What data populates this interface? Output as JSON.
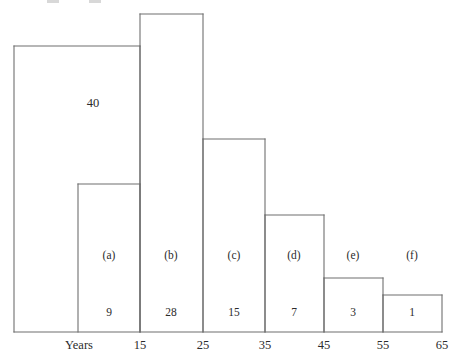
{
  "figure": {
    "background_color": "#ffffff",
    "line_color": "#6f6f6f",
    "text_color": "#2b2b2b",
    "axis_name": "Years"
  },
  "chart_data": {
    "type": "bar",
    "title": "",
    "subtitle": "",
    "xlabel": "Years",
    "ylabel": "",
    "grid": false,
    "legend_position": "none",
    "bin_edges": [
      15,
      25,
      35,
      45,
      55,
      65
    ],
    "bin_edge_labels": [
      "15",
      "25",
      "35",
      "45",
      "55",
      "65"
    ],
    "categories": [
      "(a)",
      "(b)",
      "(c)",
      "(d)",
      "(e)",
      "(f)"
    ],
    "values": [
      9,
      28,
      15,
      7,
      3,
      1
    ],
    "value_labels": [
      "9",
      "28",
      "15",
      "7",
      "3",
      "1"
    ],
    "overlay_bar": {
      "label": "40",
      "value": 40,
      "note": "tall left block spanning up to the 15 edge"
    },
    "ylim": [
      0,
      44
    ],
    "xlim": [
      5,
      65
    ],
    "bars": [
      {
        "id": "total",
        "label": "40",
        "value": 40,
        "x_left_px": 14,
        "x_right_px": 140,
        "top_px": 46,
        "bottom_px": 332,
        "label_x_px": 93,
        "label_y_px": 103
      },
      {
        "id": "a",
        "label": "(a)",
        "value": 9,
        "value_label": "9",
        "x_left_px": 78,
        "x_right_px": 140,
        "top_px": 184,
        "bottom_px": 332,
        "label_x_px": 109,
        "label_y_px": 256,
        "value_x_px": 109,
        "value_y_px": 313
      },
      {
        "id": "b",
        "label": "(b)",
        "value": 28,
        "value_label": "28",
        "x_left_px": 140,
        "x_right_px": 203,
        "top_px": 14,
        "bottom_px": 332,
        "label_x_px": 171,
        "label_y_px": 256,
        "value_x_px": 171,
        "value_y_px": 313
      },
      {
        "id": "c",
        "label": "(c)",
        "value": 15,
        "value_label": "15",
        "x_left_px": 203,
        "x_right_px": 265,
        "top_px": 139,
        "bottom_px": 332,
        "label_x_px": 234,
        "label_y_px": 256,
        "value_x_px": 234,
        "value_y_px": 313
      },
      {
        "id": "d",
        "label": "(d)",
        "value": 7,
        "value_label": "7",
        "x_left_px": 265,
        "x_right_px": 324,
        "top_px": 215,
        "bottom_px": 332,
        "label_x_px": 294,
        "label_y_px": 256,
        "value_x_px": 294,
        "value_y_px": 313
      },
      {
        "id": "e",
        "label": "(e)",
        "value": 3,
        "value_label": "3",
        "x_left_px": 324,
        "x_right_px": 383,
        "top_px": 278,
        "bottom_px": 332,
        "label_x_px": 353,
        "label_y_px": 256,
        "value_x_px": 353,
        "value_y_px": 313
      },
      {
        "id": "f",
        "label": "(f)",
        "value": 1,
        "value_label": "1",
        "x_left_px": 383,
        "x_right_px": 442,
        "top_px": 295,
        "bottom_px": 332,
        "label_x_px": 412,
        "label_y_px": 256,
        "value_x_px": 412,
        "value_y_px": 313
      }
    ],
    "ticks": [
      {
        "label": "15",
        "x_px": 140,
        "y_px": 345
      },
      {
        "label": "25",
        "x_px": 203,
        "y_px": 345
      },
      {
        "label": "35",
        "x_px": 265,
        "y_px": 345
      },
      {
        "label": "45",
        "x_px": 324,
        "y_px": 345
      },
      {
        "label": "55",
        "x_px": 383,
        "y_px": 345
      },
      {
        "label": "65",
        "x_px": 442,
        "y_px": 345
      }
    ],
    "axis_name_position": {
      "x_px": 79,
      "y_px": 345
    },
    "baseline_y_px": 332,
    "baseline_x_start_px": 14,
    "baseline_x_end_px": 442
  }
}
